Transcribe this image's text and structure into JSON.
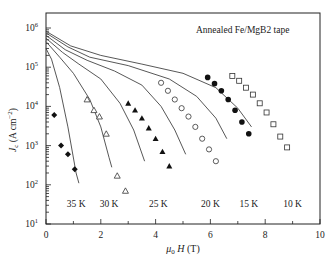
{
  "chart_data": {
    "type": "scatter",
    "title": "Annealed Fe/MgB2 tape",
    "xlabel": "μ0 H (T)",
    "ylabel": "Jc (A cm^-2)",
    "xlim": [
      0,
      10
    ],
    "ylim": [
      10,
      1000000
    ],
    "yscale": "log",
    "grid": false,
    "legend_position": "top-right annotation",
    "x_ticks": [
      "0",
      "2",
      "4",
      "6",
      "8",
      "10"
    ],
    "y_ticks": [
      "10^1",
      "10^2",
      "10^3",
      "10^4",
      "10^5",
      "10^6"
    ],
    "annotation": "Annealed Fe/MgB2 tape",
    "series": [
      {
        "name": "35 K",
        "marker": "filled-diamond",
        "x": [
          0.3,
          0.55,
          0.8,
          1.05
        ],
        "y": [
          6000,
          1000,
          600,
          250
        ],
        "label_pos": [
          1.1,
          50
        ]
      },
      {
        "name": "30 K",
        "marker": "open-triangle",
        "x": [
          1.5,
          1.75,
          1.95,
          2.2,
          2.6,
          2.9
        ],
        "y": [
          15000,
          8000,
          5500,
          2000,
          170,
          70
        ],
        "label_pos": [
          2.3,
          50
        ]
      },
      {
        "name": "25 K",
        "marker": "filled-triangle",
        "x": [
          3.0,
          3.25,
          3.5,
          3.75,
          4.0,
          4.25,
          4.5
        ],
        "y": [
          12000,
          8000,
          5000,
          2800,
          1500,
          700,
          300
        ],
        "label_pos": [
          4.1,
          50
        ]
      },
      {
        "name": "20 K",
        "marker": "open-circle",
        "x": [
          4.2,
          4.45,
          4.7,
          4.95,
          5.2,
          5.45,
          5.7,
          5.95,
          6.2
        ],
        "y": [
          40000,
          25000,
          15000,
          9000,
          5500,
          3000,
          1500,
          800,
          400
        ],
        "label_pos": [
          6.0,
          50
        ]
      },
      {
        "name": "15 K",
        "marker": "filled-circle",
        "x": [
          5.9,
          6.15,
          6.4,
          6.65,
          6.9,
          7.15,
          7.4
        ],
        "y": [
          55000,
          38000,
          25000,
          15000,
          8000,
          4000,
          2000
        ],
        "label_pos": [
          7.4,
          50
        ]
      },
      {
        "name": "10 K",
        "marker": "open-square",
        "x": [
          6.8,
          7.05,
          7.3,
          7.55,
          7.8,
          8.05,
          8.3,
          8.55,
          8.8
        ],
        "y": [
          60000,
          45000,
          30000,
          20000,
          12000,
          7000,
          3500,
          1700,
          900
        ],
        "label_pos": [
          9.0,
          50
        ]
      }
    ],
    "curves_note": "Solid lines show transport Jc(H) at 35,30,25,20,15,10 K; open/filled symbols are magnetization Jc"
  }
}
